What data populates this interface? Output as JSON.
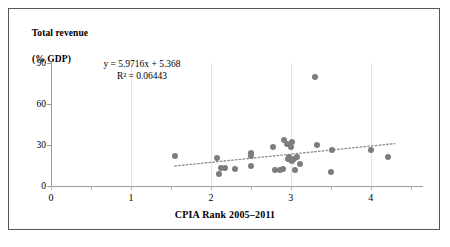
{
  "chart_data": {
    "type": "scatter",
    "title": "",
    "xlabel": "CPIA Rank 2005–2011",
    "ylabel_line1": "Total revenue",
    "ylabel_line2": "(% GDP)",
    "xlim": [
      0,
      4.64
    ],
    "ylim": [
      0,
      90
    ],
    "xticks": [
      "0",
      "1",
      "2",
      "3",
      "4"
    ],
    "xtick_values": [
      0,
      1,
      2,
      3,
      4
    ],
    "yticks": [
      "0",
      "30",
      "60",
      "90"
    ],
    "ytick_values": [
      0,
      30,
      60,
      90
    ],
    "grid": "vertical",
    "legend": "none",
    "point_color": "#7d7d7d",
    "trendline_color": "#8c8c8c",
    "trendline_style": "dotted",
    "annotations": {
      "equation": "y = 5.9716x + 5.368",
      "r_squared": "R² = 0.06443"
    },
    "trendline": {
      "slope": 5.9716,
      "intercept": 5.368,
      "x_start": 1.55,
      "x_end": 4.3
    },
    "points": [
      {
        "x": 1.55,
        "y": 22.0
      },
      {
        "x": 2.08,
        "y": 20.5
      },
      {
        "x": 2.1,
        "y": 9.0
      },
      {
        "x": 2.13,
        "y": 13.0
      },
      {
        "x": 2.17,
        "y": 13.0
      },
      {
        "x": 2.3,
        "y": 12.5
      },
      {
        "x": 2.5,
        "y": 24.0
      },
      {
        "x": 2.5,
        "y": 22.0
      },
      {
        "x": 2.5,
        "y": 14.5
      },
      {
        "x": 2.78,
        "y": 28.5
      },
      {
        "x": 2.8,
        "y": 12.0
      },
      {
        "x": 2.86,
        "y": 12.0
      },
      {
        "x": 2.9,
        "y": 12.5
      },
      {
        "x": 2.92,
        "y": 34.0
      },
      {
        "x": 2.95,
        "y": 31.0
      },
      {
        "x": 2.96,
        "y": 19.5
      },
      {
        "x": 2.98,
        "y": 21.5
      },
      {
        "x": 3.0,
        "y": 28.5
      },
      {
        "x": 3.0,
        "y": 19.0
      },
      {
        "x": 3.01,
        "y": 32.0
      },
      {
        "x": 3.02,
        "y": 18.0
      },
      {
        "x": 3.04,
        "y": 20.0
      },
      {
        "x": 3.05,
        "y": 12.0
      },
      {
        "x": 3.08,
        "y": 21.5
      },
      {
        "x": 3.12,
        "y": 16.0
      },
      {
        "x": 3.3,
        "y": 80.0
      },
      {
        "x": 3.33,
        "y": 30.0
      },
      {
        "x": 3.5,
        "y": 10.5
      },
      {
        "x": 3.52,
        "y": 26.0
      },
      {
        "x": 4.0,
        "y": 26.5
      },
      {
        "x": 4.22,
        "y": 21.5
      }
    ]
  }
}
